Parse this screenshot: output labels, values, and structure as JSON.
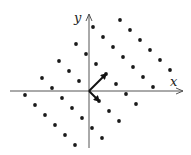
{
  "diagram": {
    "type": "lattice",
    "axes": {
      "x_label": "x",
      "y_label": "y"
    },
    "colors": {
      "ink": "#1a1a1a",
      "axis": "#555555"
    },
    "basis": {
      "short_vector": {
        "name": "b1",
        "math": [
          1,
          -1
        ]
      },
      "long_vector": {
        "name": "b2",
        "math": [
          1.7,
          1.7
        ]
      }
    },
    "lattice_rows": [
      {
        "j": -2,
        "i_range": [
          -3,
          2
        ]
      },
      {
        "j": -1,
        "i_range": [
          -3,
          3
        ]
      },
      {
        "j": 0,
        "i_range": [
          -3,
          3
        ],
        "skip_i": [
          0
        ]
      },
      {
        "j": 1,
        "i_range": [
          -3,
          3
        ]
      },
      {
        "j": 2,
        "i_range": [
          -3,
          3
        ]
      },
      {
        "j": 3,
        "i_range": [
          -2,
          3
        ]
      }
    ]
  }
}
